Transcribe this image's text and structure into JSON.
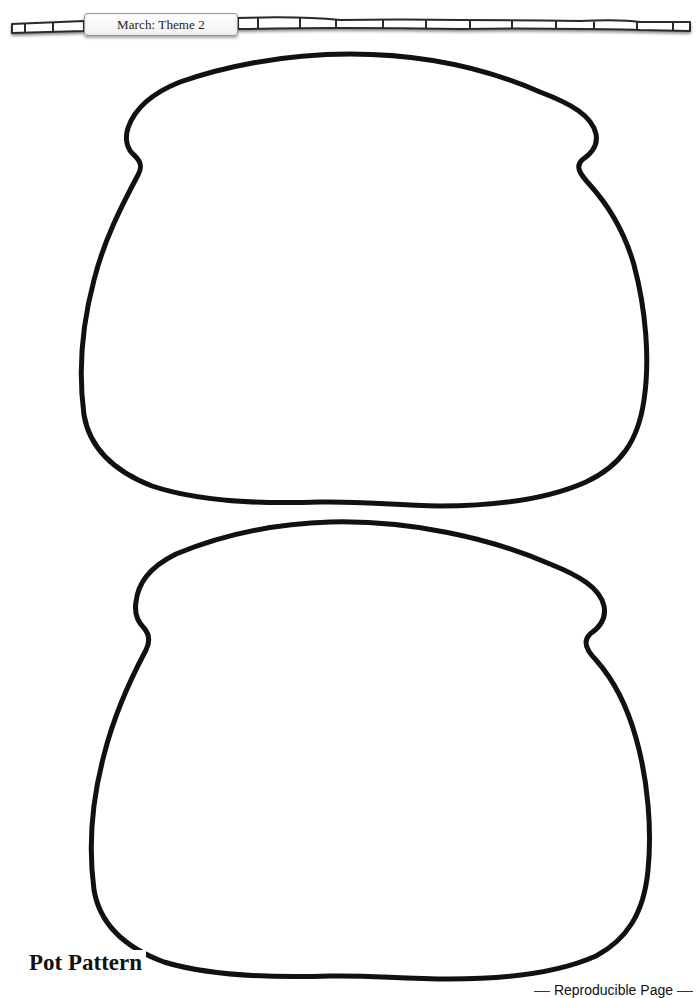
{
  "header": {
    "label": "March: Theme 2",
    "banner_style": "bamboo-strip",
    "banner_color": "#333333",
    "tab_color": "#f4f4f4"
  },
  "patterns": [
    {
      "name": "pot-outline-top",
      "shape": "pot",
      "stroke": "#111111"
    },
    {
      "name": "pot-outline-bottom",
      "shape": "pot",
      "stroke": "#111111"
    }
  ],
  "footer": {
    "title": "Pot Pattern",
    "note": "Reproducible  Page"
  }
}
